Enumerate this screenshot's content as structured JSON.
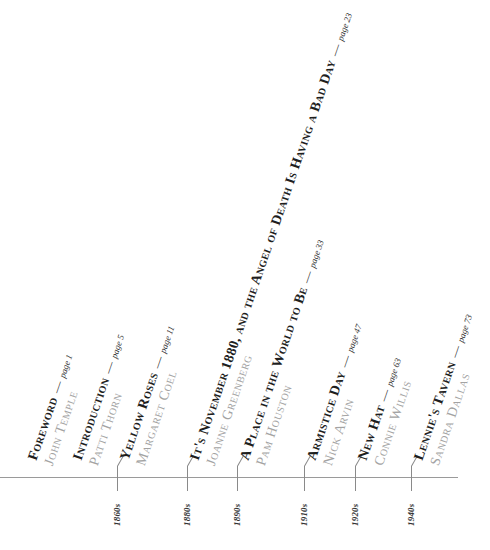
{
  "colors": {
    "title": "#1e1e1e",
    "author": "#a3a3a3",
    "axis": "#9a9a9a",
    "background": "#ffffff"
  },
  "entries": [
    {
      "title": "Foreword",
      "author": "John Temple",
      "page_label": "page",
      "page": "1",
      "era": ""
    },
    {
      "title": "Introduction",
      "author": "Patti Thorn",
      "page_label": "page",
      "page": "5",
      "era": ""
    },
    {
      "title": "Yellow Roses",
      "author": "Margaret Coel",
      "page_label": "page",
      "page": "11",
      "era": "1860s"
    },
    {
      "title": "It's November 1880, and the Angel of Death Is Having a Bad Day",
      "author": "Joanne Greenberg",
      "page_label": "page",
      "page": "23",
      "era": "1880s"
    },
    {
      "title": "A Place in the World to Be",
      "author": "Pam Houston",
      "page_label": "page",
      "page": "33",
      "era": "1890s"
    },
    {
      "title": "Armistice Day",
      "author": "Nick Arvin",
      "page_label": "page",
      "page": "47",
      "era": "1910s"
    },
    {
      "title": "New Hat",
      "author": "Connie Willis",
      "page_label": "page",
      "page": "63",
      "era": "1920s"
    },
    {
      "title": "Lennie's Tavern",
      "author": "Sandra Dallas",
      "page_label": "page",
      "page": "73",
      "era": "1940s"
    }
  ],
  "timeline": {
    "eras": [
      "1860s",
      "1880s",
      "1890s",
      "1910s",
      "1920s",
      "1940s"
    ]
  }
}
